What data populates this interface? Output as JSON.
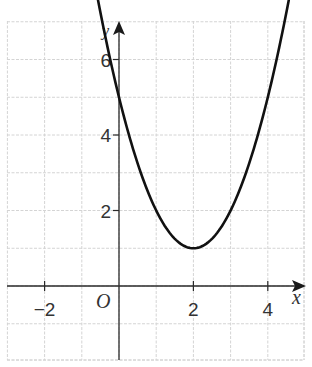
{
  "chart_data": {
    "type": "line",
    "title": "",
    "function": "y = (x - 2)^2 + 1",
    "xlabel": "x",
    "ylabel": "y",
    "origin_label": "O",
    "xlim": [
      -3,
      5
    ],
    "ylim": [
      -2,
      7
    ],
    "grid": true,
    "x_ticks": [
      {
        "value": -2,
        "label": "−2"
      },
      {
        "value": 2,
        "label": "2"
      },
      {
        "value": 4,
        "label": "4"
      }
    ],
    "y_ticks": [
      {
        "value": 2,
        "label": "2"
      },
      {
        "value": 4,
        "label": "4"
      },
      {
        "value": 6,
        "label": "6"
      }
    ],
    "series": [
      {
        "name": "parabola",
        "x": [
          -0.3,
          0,
          0.5,
          1,
          1.5,
          2,
          2.5,
          3,
          3.5,
          4,
          4.5
        ],
        "y": [
          6.29,
          5,
          3.25,
          2,
          1.25,
          1,
          1.25,
          2,
          3.25,
          5,
          7.25
        ]
      }
    ],
    "key_points": {
      "y_intercept": [
        0,
        5
      ],
      "vertex": [
        2,
        1
      ]
    },
    "colors": {
      "curve": "#111111",
      "axis": "#2a2a2a",
      "grid": "#d4d4d4"
    }
  }
}
